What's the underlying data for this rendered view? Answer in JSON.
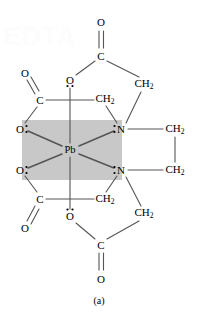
{
  "figure": {
    "caption": "(a)",
    "watermark": "EDTA",
    "shaded_box": {
      "fill": "#c8c8c8",
      "x": 22,
      "y": 120,
      "width": 100,
      "height": 60
    },
    "colors": {
      "bond": "#555555",
      "text": "#000000",
      "background": "#ffffff",
      "shade": "#c8c8c8"
    }
  },
  "atoms": [
    {
      "id": "O-top",
      "label": "O",
      "sub": "",
      "x": 101,
      "y": 22,
      "lone_pairs": "none"
    },
    {
      "id": "C-top",
      "label": "C",
      "sub": "",
      "x": 101,
      "y": 56,
      "lone_pairs": "none"
    },
    {
      "id": "O-upper-left",
      "label": "O",
      "sub": "",
      "x": 25,
      "y": 73,
      "lone_pairs": "none"
    },
    {
      "id": "O-upper-mid",
      "label": "O",
      "sub": "",
      "x": 70,
      "y": 80,
      "lone_pairs": "below"
    },
    {
      "id": "CH2-upper-right",
      "label": "CH",
      "sub": "2",
      "x": 144,
      "y": 84,
      "lone_pairs": "none"
    },
    {
      "id": "C-upper-left",
      "label": "C",
      "sub": "",
      "x": 40,
      "y": 100,
      "lone_pairs": "none"
    },
    {
      "id": "CH2-upper-mid",
      "label": "CH",
      "sub": "2",
      "x": 105,
      "y": 99,
      "lone_pairs": "none"
    },
    {
      "id": "O-box-upper",
      "label": "O",
      "sub": "",
      "x": 20,
      "y": 129,
      "lone_pairs": "right"
    },
    {
      "id": "N-upper",
      "label": "N",
      "sub": "",
      "x": 121,
      "y": 129,
      "lone_pairs": "left"
    },
    {
      "id": "CH2-right-upper",
      "label": "CH",
      "sub": "2",
      "x": 175,
      "y": 129,
      "lone_pairs": "none"
    },
    {
      "id": "Pb",
      "label": "Pb",
      "sub": "",
      "x": 70,
      "y": 150,
      "lone_pairs": "none"
    },
    {
      "id": "O-box-lower",
      "label": "O",
      "sub": "",
      "x": 20,
      "y": 170,
      "lone_pairs": "right"
    },
    {
      "id": "N-lower",
      "label": "N",
      "sub": "",
      "x": 121,
      "y": 170,
      "lone_pairs": "left"
    },
    {
      "id": "CH2-right-lower",
      "label": "CH",
      "sub": "2",
      "x": 175,
      "y": 170,
      "lone_pairs": "none"
    },
    {
      "id": "C-lower-left",
      "label": "C",
      "sub": "",
      "x": 40,
      "y": 199,
      "lone_pairs": "none"
    },
    {
      "id": "CH2-lower-mid",
      "label": "CH",
      "sub": "2",
      "x": 105,
      "y": 199,
      "lone_pairs": "none"
    },
    {
      "id": "O-lower-mid",
      "label": "O",
      "sub": "",
      "x": 70,
      "y": 216,
      "lone_pairs": "above"
    },
    {
      "id": "CH2-lower-right",
      "label": "CH",
      "sub": "2",
      "x": 144,
      "y": 213,
      "lone_pairs": "none"
    },
    {
      "id": "O-lower-left",
      "label": "O",
      "sub": "",
      "x": 25,
      "y": 228,
      "lone_pairs": "none"
    },
    {
      "id": "C-bottom",
      "label": "C",
      "sub": "",
      "x": 101,
      "y": 245,
      "lone_pairs": "none"
    },
    {
      "id": "O-bottom",
      "label": "O",
      "sub": "",
      "x": 101,
      "y": 279,
      "lone_pairs": "none"
    }
  ],
  "molecule": {
    "name": "Pb-EDTA chelate complex",
    "metal": "Pb",
    "coordinating_atoms": [
      "O",
      "O",
      "O",
      "O",
      "N",
      "N"
    ]
  }
}
